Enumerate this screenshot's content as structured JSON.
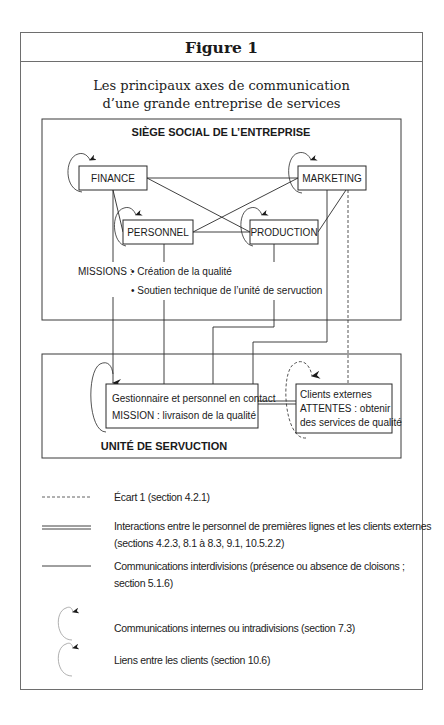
{
  "figure": {
    "label": "Figure 1",
    "subtitle_line1": "Les principaux axes de communication",
    "subtitle_line2": "d’une grande entreprise de services"
  },
  "headquarters": {
    "title": "SIÈGE SOCIAL DE L’ENTREPRISE",
    "nodes": {
      "finance": "FINANCE",
      "marketing": "MARKETING",
      "personnel": "PERSONNEL",
      "production": "PRODUCTION"
    },
    "missions_label": "MISSIONS :",
    "missions": [
      "• Création de la qualité",
      "• Soutien technique de l’unité de servuction"
    ]
  },
  "service_unit": {
    "title": "UNITÉ DE SERVUCTION",
    "staff_box": {
      "line1": "Gestionnaire et personnel en contact",
      "line2": "MISSION : livraison de la qualité"
    },
    "clients_box": {
      "line1": "Clients externes",
      "line2": "ATTENTES : obtenir",
      "line3": "des services de qualité"
    }
  },
  "legend": [
    {
      "symbol": "dashed-line-icon",
      "text": "Écart 1 (section 4.2.1)"
    },
    {
      "symbol": "double-line-icon",
      "text_line1": "Interactions entre le personnel de premières lignes et les clients externes",
      "text_line2": "(sections 4.2.3, 8.1 à 8.3, 9.1, 10.5.2.2)"
    },
    {
      "symbol": "solid-line-icon",
      "text_line1": "Communications interdivisions (présence ou absence de cloisons ;",
      "text_line2": "section 5.1.6)"
    },
    {
      "symbol": "loop-arrow-icon",
      "text": "Communications internes ou intradivisions (section 7.3)"
    },
    {
      "symbol": "loop-arrow-light-icon",
      "text": "Liens entre les clients (section 10.6)"
    }
  ],
  "colors": {
    "line": "#2a2a2a",
    "frame": "#6e6e6e",
    "legend_loop": "#9a9a9a"
  }
}
